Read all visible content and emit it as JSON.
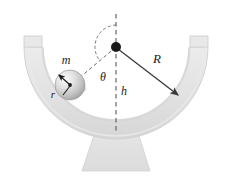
{
  "figure": {
    "background_color": "#ffffff",
    "width": 227,
    "height": 180
  },
  "labels": {
    "mass": "m",
    "sphere_radius": "r",
    "bowl_radius": "R",
    "angle": "θ",
    "height": "h"
  },
  "colors": {
    "bowl_fill": "#e3e3e3",
    "bowl_stroke": "#d2d2d2",
    "bowl_shade": "#d8d8d8",
    "sphere_light": "#f2f2f2",
    "sphere_mid": "#cfcfcf",
    "sphere_dark": "#a8a8a8",
    "line_stroke": "#3a3a3a",
    "dashed_stroke": "#5a5a5a",
    "pivot_fill": "#1a1a1a",
    "label_color": "#1a1a1a"
  },
  "geometry": {
    "pivot_x": 116,
    "pivot_y": 47,
    "bowl_inner_radius": 74,
    "bowl_outer_radius": 92,
    "sphere_center_x": 70,
    "sphere_center_y": 85,
    "sphere_radius": 15,
    "angle_from_vertical_deg": 40,
    "radius_arrow_angle_deg": 60,
    "vertical_line_top_y": 14,
    "vertical_line_bottom_y": 131,
    "arc_radius": 22,
    "pedestal_top_y": 128,
    "pedestal_bottom_y": 171
  },
  "annotations": {
    "m_x": 66,
    "m_y": 64,
    "r_x": 53,
    "r_y": 96,
    "R_x": 157,
    "R_y": 62,
    "theta_x": 103,
    "theta_y": 77,
    "h_x": 123,
    "h_y": 92
  }
}
